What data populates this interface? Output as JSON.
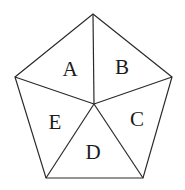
{
  "diagram": {
    "type": "pentagon-partition",
    "stroke_color": "#2a2a2a",
    "background": "#ffffff",
    "vertices": {
      "top": [
        93,
        14
      ],
      "right": [
        172,
        77
      ],
      "bottom_right": [
        143,
        178
      ],
      "bottom_left": [
        46,
        178
      ],
      "left": [
        15,
        77
      ],
      "center": [
        94,
        104
      ]
    },
    "regions": [
      {
        "label": "A",
        "x": 70,
        "y": 76
      },
      {
        "label": "B",
        "x": 122,
        "y": 74
      },
      {
        "label": "C",
        "x": 137,
        "y": 126
      },
      {
        "label": "D",
        "x": 93,
        "y": 159
      },
      {
        "label": "E",
        "x": 55,
        "y": 129
      }
    ]
  }
}
